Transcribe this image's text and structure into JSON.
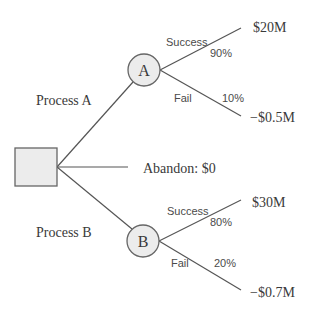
{
  "diagram": {
    "type": "decision-tree",
    "decision_node": {
      "shape": "square"
    },
    "branches": [
      {
        "label": "Process A",
        "chance_node": {
          "label": "A"
        },
        "outcomes": [
          {
            "label": "Success",
            "probability": "90%",
            "payoff": "$20M"
          },
          {
            "label": "Fail",
            "probability": "10%",
            "payoff": "−$0.5M"
          }
        ]
      },
      {
        "label": "Abandon: $0"
      },
      {
        "label": "Process B",
        "chance_node": {
          "label": "B"
        },
        "outcomes": [
          {
            "label": "Success",
            "probability": "80%",
            "payoff": "$30M"
          },
          {
            "label": "Fail",
            "probability": "20%",
            "payoff": "−$0.7M"
          }
        ]
      }
    ]
  },
  "colors": {
    "node_fill": "#ececec",
    "node_stroke": "#666666",
    "edge": "#555555",
    "text": "#3a3a3a"
  }
}
